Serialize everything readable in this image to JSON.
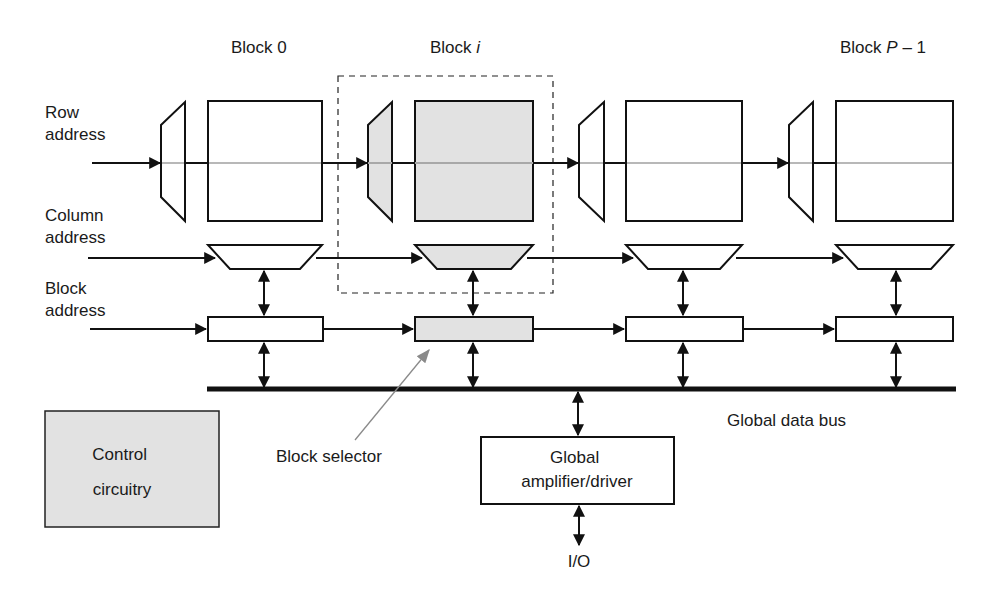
{
  "blocks": [
    {
      "title_prefix": "Block",
      "title_var": "0",
      "highlighted": false
    },
    {
      "title_prefix": "Block",
      "title_var": "i",
      "highlighted": true
    },
    {
      "title_prefix": "",
      "title_var": "",
      "highlighted": false
    },
    {
      "title_prefix": "Block",
      "title_var": "P",
      "title_suffix": " – 1",
      "highlighted": false
    }
  ],
  "inputs": {
    "row": [
      "Row",
      "address"
    ],
    "column": [
      "Column",
      "address"
    ],
    "block": [
      "Block",
      "address"
    ]
  },
  "labels": {
    "block_selector": "Block selector",
    "global_data_bus": "Global data bus",
    "global_amp": [
      "Global",
      "amplifier/driver"
    ],
    "io": "I/O",
    "control": [
      "Control",
      "circuitry"
    ]
  },
  "colors": {
    "stroke": "#111111",
    "highlight_fill": "#e2e2e2",
    "row_line": "#b8b8b8",
    "pointer": "#8a8a8a"
  }
}
